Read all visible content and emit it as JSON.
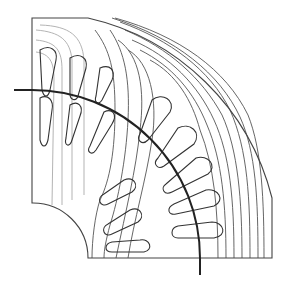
{
  "figure": {
    "colors": {
      "background": "#ffffff",
      "boundary": "#444444",
      "air_gap": "#222222",
      "flux_lines": "#555555",
      "flux_lines_light": "#aaaaaa"
    },
    "geometry": {
      "center": [
        32,
        258
      ],
      "shaft_radius": 55,
      "air_gap_radius": 168,
      "outer_radius": 246,
      "rotor_slot_count": 6,
      "stator_slot_count": 8
    }
  }
}
